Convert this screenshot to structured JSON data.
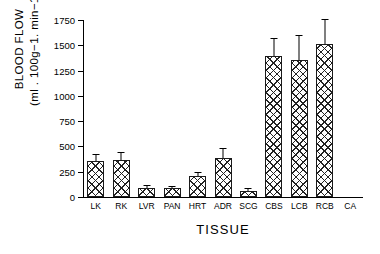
{
  "chart_data": {
    "type": "bar",
    "title": "",
    "xlabel": "TISSUE",
    "ylabel": "BLOOD FLOW (ml . 100g−1. min−1)",
    "ylabel_line1": "BLOOD FLOW",
    "ylabel_line2": "(ml . 100g−1. min−1)",
    "categories": [
      "LK",
      "RK",
      "LVR",
      "PAN",
      "HRT",
      "ADR",
      "SCG",
      "CBS",
      "LCB",
      "RCB",
      "CA"
    ],
    "values": [
      355,
      370,
      85,
      85,
      205,
      390,
      60,
      1395,
      1355,
      1510,
      0
    ],
    "errors": [
      65,
      65,
      20,
      18,
      35,
      85,
      15,
      170,
      240,
      245,
      0
    ],
    "ylim": [
      0,
      1750
    ],
    "yticks": [
      0,
      250,
      500,
      750,
      1000,
      1250,
      1500,
      1750
    ],
    "ytick_labels": [
      "0",
      "250",
      "500",
      "750",
      "1000",
      "1250",
      "1500",
      "1750"
    ],
    "grid": false,
    "legend": false,
    "error_bar_type": "upper",
    "bar_fill": "crosshatch",
    "bar_edge_color": "#1a1a1a",
    "axis_color": "#000000",
    "background_color": "#ffffff"
  }
}
